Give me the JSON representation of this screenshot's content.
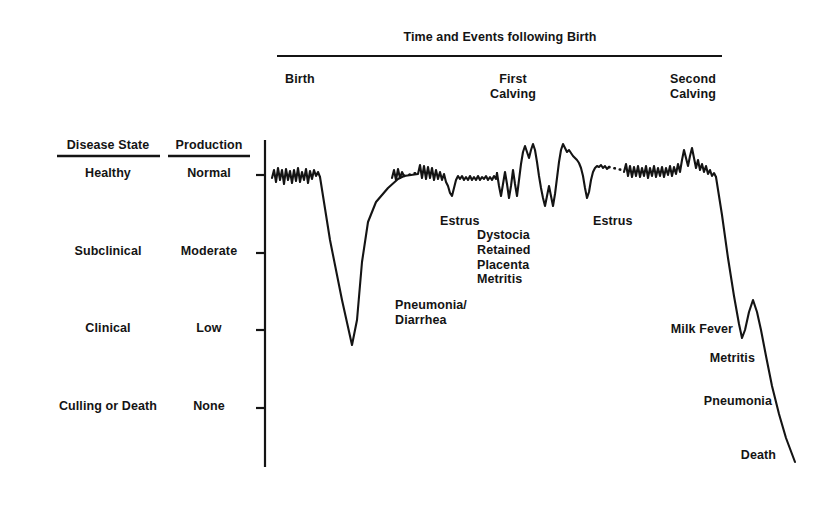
{
  "figure": {
    "title": "Time and Events following Birth",
    "background_color": "#ffffff",
    "ink_color": "#141414"
  },
  "columns": {
    "disease_state_header": "Disease State",
    "production_header": "Production"
  },
  "chart_data": {
    "type": "line",
    "title": "Time and Events following Birth",
    "xlabel": "Time and Events following Birth",
    "ylabel": "Production",
    "grid": false,
    "legend": null,
    "y_categories": [
      {
        "disease_state": "Healthy",
        "production": "Normal",
        "y": 175
      },
      {
        "disease_state": "Subclinical",
        "production": "Moderate",
        "y": 253
      },
      {
        "disease_state": "Clinical",
        "production": "Low",
        "y": 330
      },
      {
        "disease_state": "Culling or Death",
        "production": "None",
        "y": 408
      }
    ],
    "x_events": [
      {
        "label": "Birth",
        "x": 285
      },
      {
        "label": "First\nCalving",
        "x": 513
      },
      {
        "label": "Second\nCalving",
        "x": 693
      }
    ],
    "annotations": [
      {
        "text": "Pneumonia/\nDiarrhea",
        "x": 395,
        "y": 298,
        "align": "left"
      },
      {
        "text": "Estrus",
        "x": 440,
        "y": 214,
        "align": "left"
      },
      {
        "text": "Dystocia\nRetained\nPlacenta\nMetritis",
        "x": 477,
        "y": 228,
        "align": "left"
      },
      {
        "text": "Estrus",
        "x": 593,
        "y": 214,
        "align": "left"
      },
      {
        "text": "Milk Fever",
        "x": 733,
        "y": 322,
        "align": "right"
      },
      {
        "text": "Metritis",
        "x": 755,
        "y": 351,
        "align": "right"
      },
      {
        "text": "Pneumonia",
        "x": 772,
        "y": 394,
        "align": "right"
      },
      {
        "text": "Death",
        "x": 776,
        "y": 448,
        "align": "right"
      }
    ],
    "series": [
      {
        "name": "Milk production / health status",
        "description": "Lifetime production curve of a dairy cow from birth through second calving to death",
        "baseline_y": 175,
        "segments": [
          {
            "name": "calf-period-wiggle",
            "style": "solid",
            "points": [
              [
                272,
                178
              ],
              [
                274,
                170
              ],
              [
                276,
                182
              ],
              [
                278,
                168
              ],
              [
                280,
                180
              ],
              [
                282,
                170
              ],
              [
                284,
                184
              ],
              [
                286,
                169
              ],
              [
                288,
                180
              ],
              [
                290,
                171
              ],
              [
                292,
                183
              ],
              [
                294,
                170
              ],
              [
                296,
                181
              ],
              [
                298,
                168
              ],
              [
                300,
                182
              ],
              [
                302,
                172
              ],
              [
                304,
                180
              ],
              [
                306,
                169
              ],
              [
                308,
                183
              ],
              [
                310,
                171
              ],
              [
                312,
                179
              ],
              [
                314,
                170
              ],
              [
                316,
                176
              ],
              [
                318,
                172
              ],
              [
                320,
                177
              ]
            ]
          },
          {
            "name": "pneumonia-diarrhea-crash",
            "style": "solid",
            "points": [
              [
                320,
                177
              ],
              [
                330,
                240
              ],
              [
                342,
                300
              ],
              [
                352,
                345
              ],
              [
                357,
                320
              ],
              [
                362,
                262
              ],
              [
                368,
                222
              ],
              [
                376,
                202
              ],
              [
                388,
                188
              ],
              [
                398,
                179
              ],
              [
                404,
                176
              ]
            ]
          },
          {
            "name": "dotted-gap-1",
            "style": "dotted",
            "points": [
              [
                404,
                176
              ],
              [
                416,
                173
              ]
            ]
          },
          {
            "name": "heifer-baseline",
            "style": "solid",
            "points": [
              [
                392,
                178
              ],
              [
                394,
                170
              ],
              [
                396,
                180
              ],
              [
                398,
                169
              ],
              [
                400,
                178
              ],
              [
                402,
                172
              ],
              [
                404,
                176
              ],
              [
                418,
                174
              ],
              [
                420,
                165
              ],
              [
                422,
                178
              ],
              [
                424,
                166
              ],
              [
                426,
                179
              ],
              [
                428,
                167
              ],
              [
                430,
                178
              ],
              [
                432,
                168
              ],
              [
                434,
                180
              ],
              [
                436,
                170
              ],
              [
                438,
                179
              ],
              [
                440,
                172
              ],
              [
                442,
                180
              ],
              [
                444,
                174
              ],
              [
                446,
                182
              ],
              [
                448,
                186
              ],
              [
                450,
                193
              ],
              [
                452,
                196
              ],
              [
                454,
                188
              ],
              [
                456,
                180
              ],
              [
                458,
                176
              ],
              [
                460,
                179
              ],
              [
                462,
                176
              ],
              [
                464,
                180
              ],
              [
                466,
                177
              ],
              [
                468,
                180
              ],
              [
                470,
                176
              ],
              [
                472,
                180
              ],
              [
                474,
                177
              ],
              [
                476,
                180
              ],
              [
                478,
                176
              ],
              [
                480,
                180
              ],
              [
                482,
                177
              ],
              [
                484,
                179
              ],
              [
                486,
                176
              ],
              [
                488,
                180
              ],
              [
                490,
                177
              ],
              [
                492,
                180
              ],
              [
                494,
                176
              ],
              [
                496,
                179
              ],
              [
                497,
                173
              ]
            ]
          },
          {
            "name": "first-lactation-disease-cluster",
            "style": "solid",
            "points": [
              [
                497,
                173
              ],
              [
                499,
                186
              ],
              [
                501,
                196
              ],
              [
                503,
                184
              ],
              [
                505,
                172
              ],
              [
                507,
                184
              ],
              [
                509,
                198
              ],
              [
                511,
                186
              ],
              [
                513,
                170
              ],
              [
                515,
                184
              ],
              [
                517,
                196
              ],
              [
                519,
                180
              ],
              [
                521,
                164
              ],
              [
                523,
                152
              ],
              [
                525,
                146
              ],
              [
                527,
                152
              ],
              [
                529,
                158
              ],
              [
                531,
                150
              ],
              [
                533,
                144
              ],
              [
                535,
                150
              ],
              [
                537,
                162
              ],
              [
                539,
                176
              ],
              [
                541,
                188
              ],
              [
                543,
                198
              ],
              [
                545,
                206
              ],
              [
                547,
                196
              ],
              [
                549,
                186
              ],
              [
                551,
                196
              ],
              [
                553,
                206
              ],
              [
                555,
                194
              ],
              [
                557,
                178
              ],
              [
                559,
                162
              ],
              [
                561,
                150
              ],
              [
                563,
                144
              ],
              [
                565,
                148
              ],
              [
                567,
                152
              ],
              [
                569,
                150
              ],
              [
                571,
                153
              ],
              [
                573,
                156
              ],
              [
                575,
                158
              ],
              [
                577,
                160
              ],
              [
                579,
                163
              ],
              [
                581,
                168
              ],
              [
                583,
                176
              ],
              [
                585,
                188
              ],
              [
                587,
                198
              ],
              [
                589,
                192
              ],
              [
                591,
                180
              ],
              [
                593,
                172
              ],
              [
                595,
                168
              ],
              [
                597,
                166
              ],
              [
                599,
                167
              ],
              [
                601,
                165
              ],
              [
                603,
                168
              ],
              [
                605,
                166
              ],
              [
                607,
                169
              ],
              [
                609,
                167
              ]
            ]
          },
          {
            "name": "dotted-gap-2",
            "style": "dotted",
            "points": [
              [
                609,
                167
              ],
              [
                622,
                170
              ]
            ]
          },
          {
            "name": "dry-period-baseline",
            "style": "solid",
            "points": [
              [
                624,
                172
              ],
              [
                626,
                164
              ],
              [
                628,
                176
              ],
              [
                630,
                166
              ],
              [
                632,
                177
              ],
              [
                634,
                167
              ],
              [
                636,
                176
              ],
              [
                638,
                166
              ],
              [
                640,
                177
              ],
              [
                642,
                168
              ],
              [
                644,
                176
              ],
              [
                646,
                166
              ],
              [
                648,
                178
              ],
              [
                650,
                168
              ],
              [
                652,
                176
              ],
              [
                654,
                166
              ],
              [
                656,
                177
              ],
              [
                658,
                168
              ],
              [
                660,
                176
              ],
              [
                662,
                167
              ],
              [
                664,
                177
              ],
              [
                666,
                168
              ],
              [
                668,
                175
              ],
              [
                670,
                166
              ],
              [
                672,
                176
              ],
              [
                674,
                167
              ],
              [
                676,
                174
              ],
              [
                678,
                164
              ],
              [
                680,
                172
              ],
              [
                682,
                160
              ],
              [
                684,
                150
              ],
              [
                686,
                158
              ],
              [
                688,
                166
              ],
              [
                690,
                156
              ],
              [
                692,
                148
              ],
              [
                694,
                158
              ],
              [
                696,
                168
              ],
              [
                698,
                160
              ],
              [
                700,
                170
              ],
              [
                702,
                164
              ],
              [
                704,
                172
              ],
              [
                706,
                166
              ],
              [
                708,
                174
              ],
              [
                710,
                170
              ],
              [
                712,
                176
              ],
              [
                714,
                173
              ],
              [
                716,
                177
              ]
            ]
          },
          {
            "name": "terminal-decline",
            "style": "solid",
            "points": [
              [
                716,
                177
              ],
              [
                722,
                215
              ],
              [
                728,
                258
              ],
              [
                734,
                296
              ],
              [
                739,
                324
              ],
              [
                742,
                338
              ],
              [
                745,
                330
              ],
              [
                749,
                312
              ],
              [
                753,
                300
              ],
              [
                757,
                312
              ],
              [
                761,
                330
              ],
              [
                766,
                356
              ],
              [
                772,
                386
              ],
              [
                779,
                414
              ],
              [
                786,
                438
              ],
              [
                795,
                462
              ]
            ]
          }
        ]
      }
    ],
    "axis": {
      "y_axis_x": 265,
      "y_axis_top": 140,
      "y_axis_bottom": 467,
      "tick_length": 9,
      "title_rule": {
        "x1": 277,
        "x2": 722,
        "y": 56
      }
    }
  }
}
